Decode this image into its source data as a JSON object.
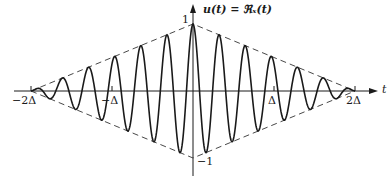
{
  "figure": {
    "y_axis_label": "u(t) = ℜₓ(t)",
    "x_axis_label": "t",
    "y_tick_top": "1",
    "y_tick_bottom": "−1",
    "x_ticks": [
      "−2Δ",
      "−Δ",
      "Δ",
      "2Δ"
    ],
    "colors": {
      "curve": "#1a1a1a",
      "axis": "#1a1a1a",
      "envelope": "#333333",
      "background": "#ffffff"
    }
  },
  "chart_data": {
    "type": "line",
    "title": "",
    "xlabel": "t",
    "ylabel": "u(t) = Re x(t)",
    "x_range": [
      "-2Δ",
      "2Δ"
    ],
    "y_range": [
      -1,
      1
    ],
    "x_ticks": [
      "-2Δ",
      "-Δ",
      "Δ",
      "2Δ"
    ],
    "y_ticks": [
      -1,
      1
    ],
    "envelope": {
      "style": "dashed",
      "shape": "triangle",
      "points": [
        [
          -2,
          0
        ],
        [
          0,
          1
        ],
        [
          2,
          0
        ],
        [
          0,
          -1
        ]
      ],
      "x_unit": "Δ"
    },
    "carrier_cycles_per_delta": 3.1,
    "series": [
      {
        "name": "u(t)",
        "style": "solid",
        "formula": "(1 - |t|/(2Δ)) * cos(2π * 3.1 * t/Δ)"
      }
    ],
    "grid": false,
    "legend": "none"
  }
}
